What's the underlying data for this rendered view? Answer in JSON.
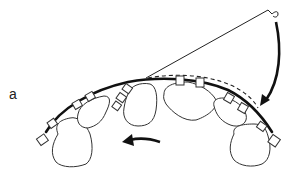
{
  "figure": {
    "panel_label": "a",
    "colors": {
      "line": "#111111",
      "tooth_fill": "#ffffff",
      "background": "#ffffff"
    },
    "elements": {
      "teeth_count": 6,
      "brackets_count": 12,
      "archwire": "solid-thick",
      "alternate_wire": "dashed",
      "ligature": "thin-line-with-hook",
      "arrows": [
        "curved-down-right",
        "curved-left"
      ]
    }
  }
}
